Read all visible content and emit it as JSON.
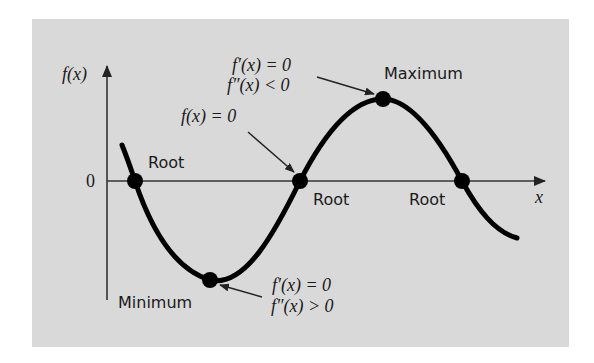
{
  "figure": {
    "panel_color": "#d9d9d9",
    "curve_color": "#000000",
    "axes": {
      "y_label": "f(x)",
      "x_label": "x",
      "origin_label": "0"
    },
    "points": [
      {
        "id": "root-1",
        "label": "Root",
        "cx": 135,
        "cy": 181
      },
      {
        "id": "minimum",
        "label": "Minimum",
        "cx": 210,
        "cy": 280
      },
      {
        "id": "root-2",
        "label": "Root",
        "cx": 300,
        "cy": 181
      },
      {
        "id": "maximum",
        "label": "Maximum",
        "cx": 383,
        "cy": 99
      },
      {
        "id": "root-3",
        "label": "Root",
        "cx": 462,
        "cy": 181
      }
    ],
    "annotations": {
      "root": {
        "line1": "f(x) = 0"
      },
      "maximum": {
        "line1": "f′(x) = 0",
        "line2": "f″(x) < 0"
      },
      "minimum": {
        "line1": "f′(x) = 0",
        "line2": "f″(x) > 0"
      }
    },
    "labels": {
      "root_1": "Root",
      "root_2": "Root",
      "root_3": "Root",
      "maximum": "Maximum",
      "minimum": "Minimum"
    }
  }
}
